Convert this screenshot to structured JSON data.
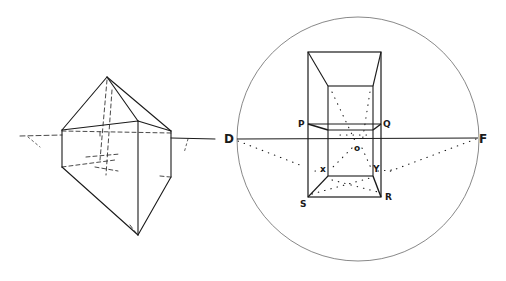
{
  "figure": {
    "background": "#ffffff",
    "ink": "#1a1a1a",
    "left_figure": {
      "description": "pentagonal/triangular bipyramid crystal in perspective with hidden dashed edges and horizon line"
    },
    "right_figure": {
      "description": "box seen in one-point perspective inside circle of vision with dotted construction lines to vanishing points",
      "labels": {
        "D": "D",
        "F": "F",
        "P": "P",
        "Q": "Q",
        "O": "o",
        "X": "x",
        "Y": "Y",
        "S": "S",
        "R": "R"
      }
    }
  }
}
